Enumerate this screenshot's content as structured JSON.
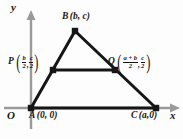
{
  "figure": {
    "background_color": "#fdfdfd",
    "line_color": "#161616",
    "axis_color": "#9a9a9a",
    "axes": {
      "x_label": "x",
      "y_label": "y",
      "origin_label": "O"
    },
    "points": [
      {
        "id": "A",
        "name": "A",
        "coords_text": "(0, 0)",
        "x_expr": "0",
        "y_expr": "0",
        "px": 31,
        "py": 108
      },
      {
        "id": "B",
        "name": "B",
        "coords_text": "(b, c)",
        "x_expr": "b",
        "y_expr": "c",
        "px": 75,
        "py": 31
      },
      {
        "id": "C",
        "name": "C",
        "coords_text": "(a,0)",
        "x_expr": "a",
        "y_expr": "0",
        "px": 156,
        "py": 108
      },
      {
        "id": "P",
        "name": "P",
        "x_num": "b",
        "x_den": "2",
        "y_num": "c",
        "y_den": "2",
        "px": 53,
        "py": 70
      },
      {
        "id": "Q",
        "name": "Q",
        "x_num": "a + b",
        "x_den": "2",
        "y_num": "c",
        "y_den": "2",
        "px": 115,
        "py": 70
      }
    ],
    "segments": [
      {
        "name": "side-AB",
        "from": "A",
        "to": "B"
      },
      {
        "name": "side-BC",
        "from": "B",
        "to": "C"
      },
      {
        "name": "side-AC",
        "from": "A",
        "to": "C"
      },
      {
        "name": "midsegment-PQ",
        "from": "P",
        "to": "Q"
      }
    ],
    "punctuation": {
      "open_paren": "(",
      "close_paren": ")",
      "comma": ","
    }
  }
}
